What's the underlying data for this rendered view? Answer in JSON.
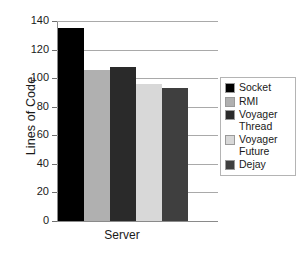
{
  "chart_data": {
    "type": "bar",
    "title": "",
    "xlabel": "Server",
    "ylabel": "Lines of Code",
    "categories": [
      "Server"
    ],
    "ylim": [
      0,
      140
    ],
    "yticks": [
      0,
      20,
      40,
      60,
      80,
      100,
      120,
      140
    ],
    "ytick_labels": [
      "0",
      "20",
      "40",
      "60",
      "80",
      "100",
      "120",
      "140"
    ],
    "grid": true,
    "legend_position": "right",
    "series": [
      {
        "name": "Socket",
        "values": [
          135
        ],
        "color": "#000000"
      },
      {
        "name": "RMI",
        "values": [
          106
        ],
        "color": "#b0b0b0"
      },
      {
        "name": "Voyager\nThread",
        "values": [
          108
        ],
        "color": "#2a2a2a"
      },
      {
        "name": "Voyager\nFuture",
        "values": [
          96
        ],
        "color": "#d8d8d8"
      },
      {
        "name": "Dejay",
        "values": [
          93
        ],
        "color": "#3f3f3f"
      }
    ]
  },
  "legend": {
    "items": [
      {
        "label": "Socket"
      },
      {
        "label": "RMI"
      },
      {
        "label": "Voyager\nThread"
      },
      {
        "label": "Voyager\nFuture"
      },
      {
        "label": "Dejay"
      }
    ]
  },
  "axes": {
    "y_title": "Lines of Code",
    "x_title": "Server"
  }
}
